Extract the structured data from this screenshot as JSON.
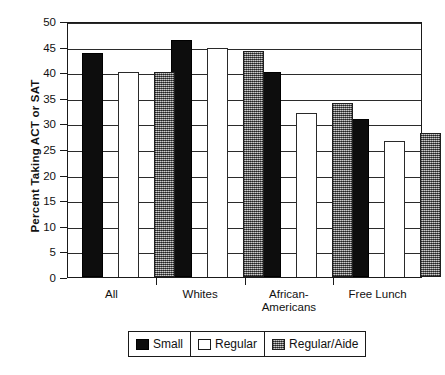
{
  "chart_data": {
    "type": "bar",
    "title": "",
    "xlabel": "",
    "ylabel": "Percent Taking ACT or SAT",
    "ylim": [
      0,
      50
    ],
    "ytick_step": 5,
    "yticks": [
      "50",
      "45",
      "40",
      "35",
      "30",
      "25",
      "20",
      "15",
      "10",
      "5",
      "0"
    ],
    "grid": true,
    "legend_position": "bottom",
    "categories": [
      "All",
      "Whites",
      "African-Americans",
      "Free Lunch"
    ],
    "category_lines": [
      [
        "All"
      ],
      [
        "Whites"
      ],
      [
        "African-",
        "Americans"
      ],
      [
        "Free Lunch"
      ]
    ],
    "series": [
      {
        "name": "Small",
        "values": [
          43.7,
          46.3,
          40.1,
          30.9
        ]
      },
      {
        "name": "Regular",
        "values": [
          40.0,
          44.8,
          32.1,
          26.6
        ]
      },
      {
        "name": "Regular/Aide",
        "values": [
          40.0,
          44.2,
          33.9,
          28.2
        ]
      }
    ]
  },
  "legend": {
    "entries": [
      {
        "label": "Small",
        "swatch": "solid-black-swatch"
      },
      {
        "label": "Regular",
        "swatch": "outline-white-swatch"
      },
      {
        "label": "Regular/Aide",
        "swatch": "stippled-gray-swatch"
      }
    ]
  },
  "colors": {
    "small": "#0d0d0d",
    "regular": "#ffffff",
    "regular_aide": "#8d8d8d",
    "axis": "#1a1a1a",
    "background": "#ffffff"
  }
}
